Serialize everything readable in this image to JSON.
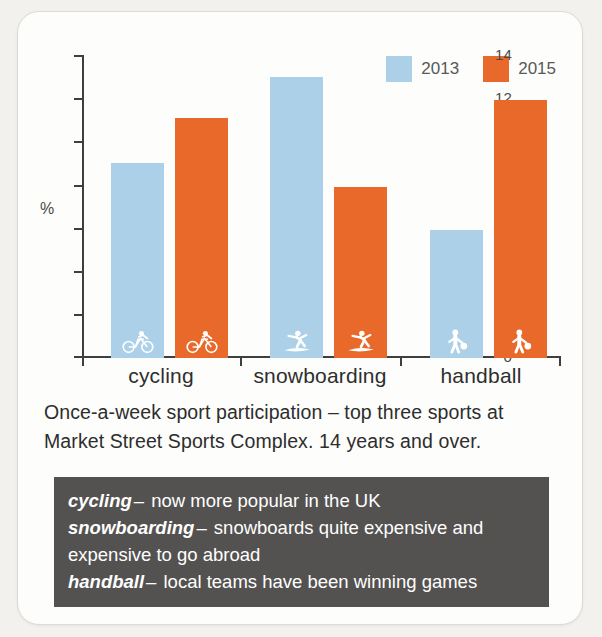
{
  "chart_data": {
    "type": "bar",
    "title": "",
    "xlabel": "",
    "ylabel": "%",
    "ylim": [
      0,
      14
    ],
    "yticks": [
      0,
      2,
      4,
      6,
      8,
      10,
      12,
      14
    ],
    "grid": false,
    "legend_position": "top-right",
    "categories": [
      "cycling",
      "snowboarding",
      "handball"
    ],
    "series": [
      {
        "name": "2013",
        "color": "#abd0e8",
        "values": [
          9.0,
          13.0,
          5.9
        ]
      },
      {
        "name": "2015",
        "color": "#e8692a",
        "values": [
          11.1,
          7.9,
          11.9
        ]
      }
    ],
    "category_icons": [
      "bicycle-icon",
      "snowboarder-icon",
      "handball-player-icon"
    ]
  },
  "legend": {
    "items": [
      {
        "label": "2013",
        "color": "#abd0e8"
      },
      {
        "label": "2015",
        "color": "#e8692a"
      }
    ]
  },
  "axis": {
    "y_unit_label": "%",
    "y_tick_labels": [
      "14",
      "12",
      "10",
      "8",
      "6",
      "4",
      "2",
      "0"
    ]
  },
  "caption": {
    "line1": "Once-a-week sport participation – top three sports at",
    "line2": "Market Street Sports Complex. 14 years and over."
  },
  "notes": {
    "items": [
      {
        "term": "cycling",
        "dash": "–",
        "text": "now more popular in the UK"
      },
      {
        "term": "snowboarding",
        "dash": "–",
        "text": "snowboards quite expensive and expensive to go abroad"
      },
      {
        "term": "handball",
        "dash": "–",
        "text": "local teams have been winning games"
      }
    ]
  }
}
